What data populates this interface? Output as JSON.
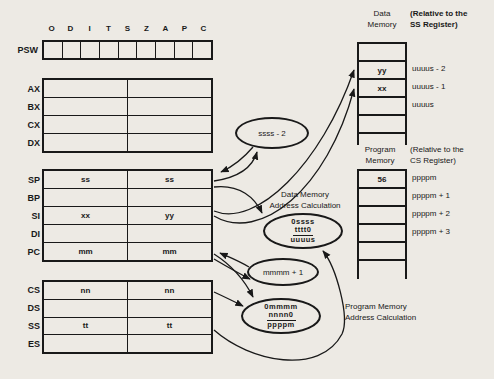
{
  "figure": {
    "psw": {
      "label": "PSW",
      "flags": [
        "O",
        "D",
        "I",
        "T",
        "S",
        "Z",
        "A",
        "P",
        "C"
      ]
    },
    "general_registers": [
      {
        "label": "AX",
        "hi": "",
        "lo": ""
      },
      {
        "label": "BX",
        "hi": "",
        "lo": ""
      },
      {
        "label": "CX",
        "hi": "",
        "lo": ""
      },
      {
        "label": "DX",
        "hi": "",
        "lo": ""
      }
    ],
    "pointer_registers": [
      {
        "label": "SP",
        "hi": "ss",
        "lo": "ss"
      },
      {
        "label": "BP",
        "hi": "",
        "lo": ""
      },
      {
        "label": "SI",
        "hi": "xx",
        "lo": "yy"
      },
      {
        "label": "DI",
        "hi": "",
        "lo": ""
      },
      {
        "label": "PC",
        "hi": "mm",
        "lo": "mm"
      }
    ],
    "segment_registers": [
      {
        "label": "CS",
        "hi": "nn",
        "lo": "nn"
      },
      {
        "label": "DS",
        "hi": "",
        "lo": ""
      },
      {
        "label": "SS",
        "hi": "tt",
        "lo": "tt"
      },
      {
        "label": "ES",
        "hi": "",
        "lo": ""
      }
    ],
    "calc": {
      "sp_decrement": "ssss - 2",
      "pc_increment": "mmmm + 1",
      "data_addr": {
        "addend1": "0ssss",
        "addend2": "tttt0",
        "sum": "uuuus"
      },
      "prog_addr": {
        "addend1": "0mmmm",
        "addend2": "nnnn0",
        "sum": "ppppm"
      },
      "data_label_1": "Data Memory",
      "data_label_2": "Address Calculation",
      "prog_label_1": "Program Memory",
      "prog_label_2": "Address Calculation"
    },
    "data_memory": {
      "title_1": "Data",
      "title_2": "Memory",
      "note_1": "(Relative to the",
      "note_2": "SS Register)",
      "cells": [
        "",
        "yy",
        "xx",
        "",
        ""
      ],
      "addresses": [
        "",
        "uuuus - 2",
        "uuuus - 1",
        "uuuus",
        ""
      ]
    },
    "program_memory": {
      "title_1": "Program",
      "title_2": "Memory",
      "note_1": "(Relative to the",
      "note_2": "CS Register)",
      "cells": [
        "56",
        "",
        "",
        "",
        ""
      ],
      "addresses": [
        "ppppm",
        "ppppm + 1",
        "ppppm + 2",
        "ppppm + 3",
        ""
      ]
    }
  }
}
